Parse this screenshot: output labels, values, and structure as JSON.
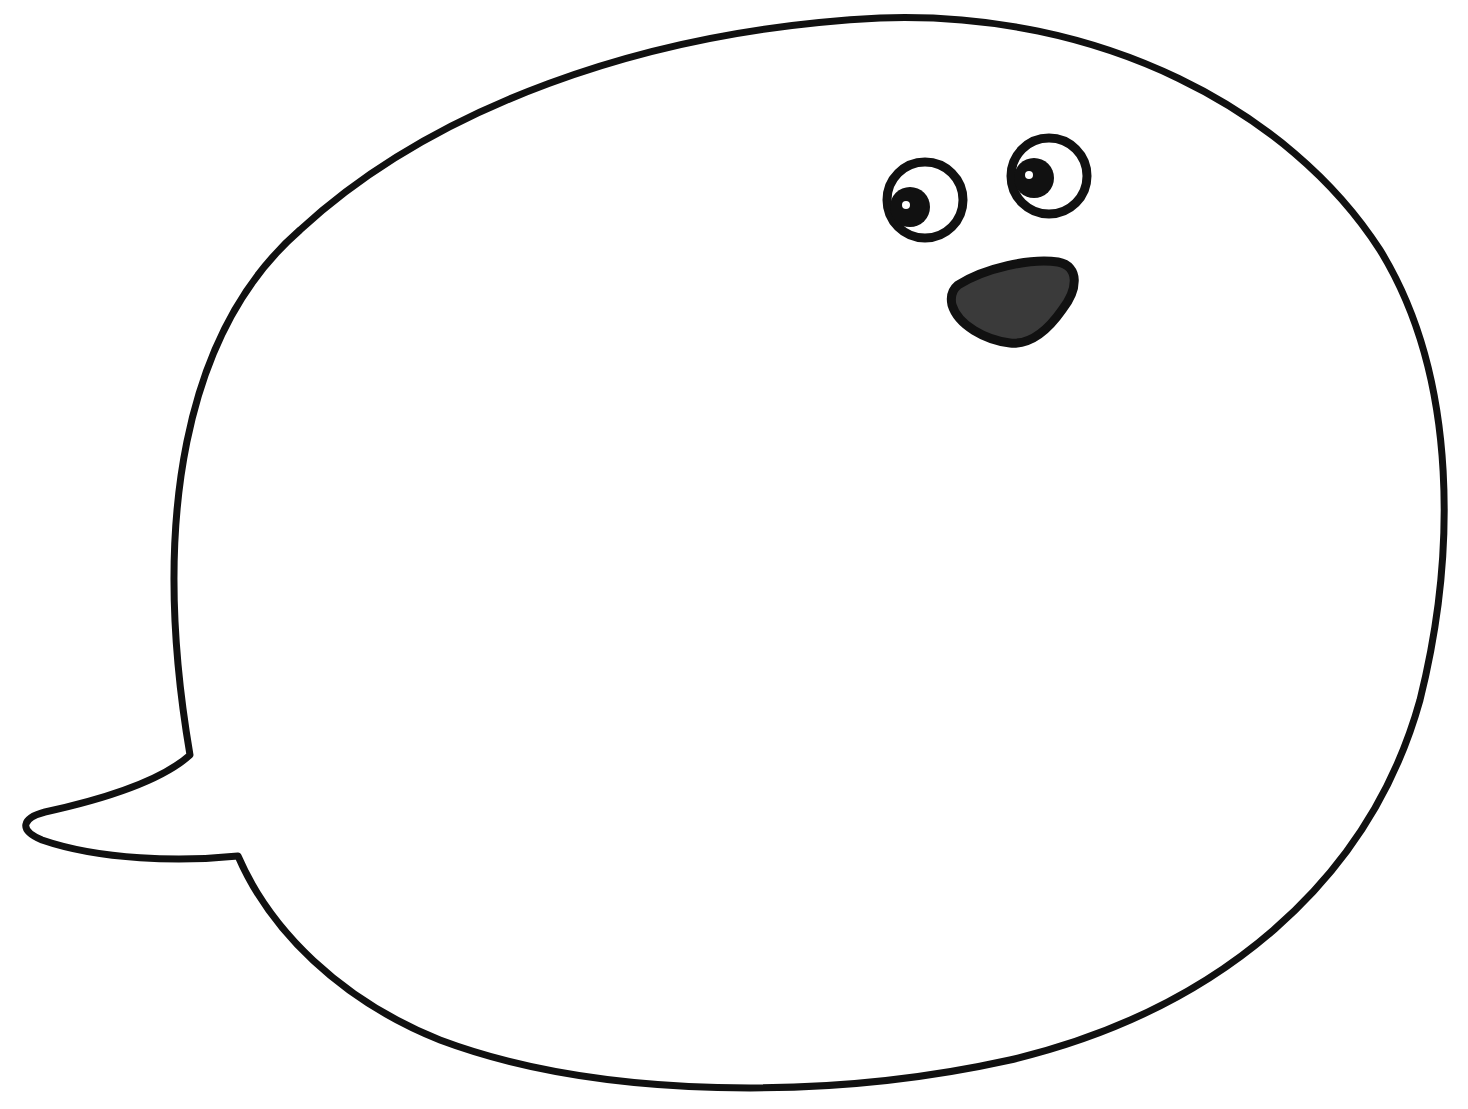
{
  "illustration": {
    "subject": "speech bubble with cartoon face",
    "colors": {
      "background": "#ffffff",
      "outline": "#111111",
      "mouth_fill": "#3a3a3a",
      "eye_highlight": "#ffffff"
    },
    "parts": [
      "speech-bubble-outline",
      "left-eye",
      "right-eye",
      "mouth"
    ]
  }
}
